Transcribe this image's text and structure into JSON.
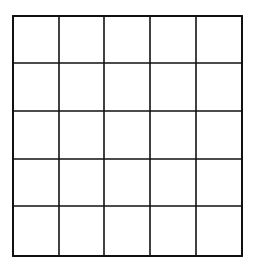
{
  "diagram": {
    "type": "grid",
    "rows": 5,
    "columns": 5,
    "line_color": "#111111",
    "background_color": "#ffffff",
    "vertical_lines_x": [
      13,
      59,
      104,
      150,
      196,
      242
    ],
    "horizontal_lines_y": [
      16,
      63,
      111,
      159,
      206,
      256
    ],
    "cells": [
      [
        "",
        "",
        "",
        "",
        ""
      ],
      [
        "",
        "",
        "",
        "",
        ""
      ],
      [
        "",
        "",
        "",
        "",
        ""
      ],
      [
        "",
        "",
        "",
        "",
        ""
      ],
      [
        "",
        "",
        "",
        "",
        ""
      ]
    ]
  }
}
